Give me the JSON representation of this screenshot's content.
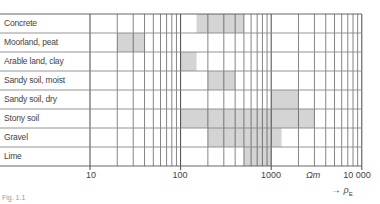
{
  "chart_data": {
    "type": "range_bar",
    "title": "",
    "xscale": "log",
    "xlim": [
      10,
      10000
    ],
    "xticks": [
      10,
      100,
      1000,
      10000
    ],
    "xtick_labels": [
      "10",
      "100",
      "1000",
      "10 000"
    ],
    "xlabel_unit": "Ωm",
    "xlabel_symbol": "ρ",
    "xlabel_subscript": "E",
    "grid": true,
    "categories": [
      "Concrete",
      "Moorland, peat",
      "Arable land, clay",
      "Sandy soil, moist",
      "Sandy soil, dry",
      "Stony soil",
      "Gravel",
      "Lime"
    ],
    "ranges": [
      {
        "category": "Concrete",
        "min": 150,
        "max": 500
      },
      {
        "category": "Moorland, peat",
        "min": 20,
        "max": 40
      },
      {
        "category": "Arable land, clay",
        "min": 100,
        "max": 150
      },
      {
        "category": "Sandy soil, moist",
        "min": 200,
        "max": 400
      },
      {
        "category": "Sandy soil, dry",
        "min": 1000,
        "max": 2000
      },
      {
        "category": "Stony soil",
        "min": 100,
        "max": 3000
      },
      {
        "category": "Gravel",
        "min": 200,
        "max": 1300
      },
      {
        "category": "Lime",
        "min": 500,
        "max": 1000
      }
    ],
    "colors": {
      "shade": "#d4d4d4",
      "grid": "#333333",
      "row_line": "#888888"
    }
  },
  "labels": {
    "rows": [
      "Concrete",
      "Moorland, peat",
      "Arable land, clay",
      "Sandy soil, moist",
      "Sandy soil, dry",
      "Stony soil",
      "Gravel",
      "Lime"
    ],
    "ticks": [
      "10",
      "100",
      "1000",
      "10 000"
    ],
    "unit": "Ωm",
    "axis_arrow": "→",
    "axis_symbol": "ρ",
    "axis_subscript": "E",
    "caption": "Fig. 1.1"
  }
}
